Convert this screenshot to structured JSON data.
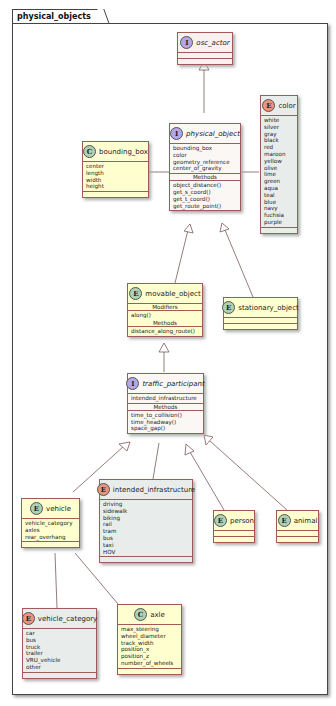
{
  "package": {
    "name": "physical_objects"
  },
  "classes": {
    "osc_actor": {
      "stereo": "I",
      "name": "osc_actor"
    },
    "physical_object": {
      "stereo": "I",
      "name": "physical_object",
      "fields": [
        "bounding_box",
        "color",
        "geometry_reference",
        "center_of_gravity"
      ],
      "methods_label": "Methods",
      "methods": [
        "object_distance()",
        "get_s_coord()",
        "get_t_coord()",
        "get_route_point()"
      ]
    },
    "bounding_box": {
      "stereo": "C",
      "name": "bounding_box",
      "fields": [
        "center",
        "length",
        "width",
        "height"
      ]
    },
    "color": {
      "stereo": "E",
      "name": "color",
      "values": [
        "white",
        "silver",
        "gray",
        "black",
        "red",
        "maroon",
        "yellow",
        "olive",
        "lime",
        "green",
        "aqua",
        "teal",
        "blue",
        "navy",
        "fuchsia",
        "purple"
      ]
    },
    "movable_object": {
      "stereo": "E",
      "name": "movable_object",
      "modifiers_label": "Modifiers",
      "modifiers": [
        "along()"
      ],
      "methods_label": "Methods",
      "methods": [
        "distance_along_route()"
      ]
    },
    "stationary_object": {
      "stereo": "E",
      "name": "stationary_object"
    },
    "traffic_participant": {
      "stereo": "I",
      "name": "traffic_participant",
      "fields": [
        "intended_infrastructure"
      ],
      "methods_label": "Methods",
      "methods": [
        "time_to_collision()",
        "time_headway()",
        "space_gap()"
      ]
    },
    "vehicle": {
      "stereo": "E",
      "name": "vehicle",
      "fields": [
        "vehicle_category",
        "axles",
        "rear_overhang"
      ]
    },
    "intended_infrastructure": {
      "stereo": "E",
      "name": "intended_infrastructure",
      "values": [
        "driving",
        "sidewalk",
        "biking",
        "rail",
        "tram",
        "bus",
        "taxi",
        "HOV"
      ]
    },
    "person": {
      "stereo": "E",
      "name": "person"
    },
    "animal": {
      "stereo": "E",
      "name": "animal"
    },
    "vehicle_category": {
      "stereo": "E",
      "name": "vehicle_category",
      "values": [
        "car",
        "bus",
        "truck",
        "trailer",
        "VRU_vehicle",
        "other"
      ]
    },
    "axle": {
      "stereo": "C",
      "name": "axle",
      "fields": [
        "max_steering",
        "wheel_diameter",
        "track_width",
        "position_x",
        "position_z",
        "number_of_wheels"
      ]
    }
  }
}
